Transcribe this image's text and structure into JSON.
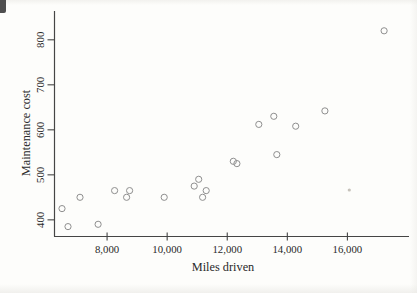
{
  "page": {
    "artifacts": {
      "corner_tab_color": "#4f4f4f",
      "speck_color": "#b3ada4"
    }
  },
  "chart_data": {
    "type": "scatter",
    "title": "",
    "xlabel": "Miles driven",
    "ylabel": "Maintenance cost",
    "xlim": [
      6250,
      18050
    ],
    "ylim": [
      363,
      864
    ],
    "grid": false,
    "legend": null,
    "axis_color": "#454545",
    "text_color": "#2a2a2a",
    "marker": {
      "shape": "open-circle",
      "radius": 3.1,
      "color": "#8f8f8f"
    },
    "xticks": [
      {
        "value": 8000,
        "label": "8,000"
      },
      {
        "value": 10000,
        "label": "10,000"
      },
      {
        "value": 12000,
        "label": "12,000"
      },
      {
        "value": 14000,
        "label": "14,000"
      },
      {
        "value": 16000,
        "label": "16,000"
      }
    ],
    "yticks": [
      {
        "value": 400,
        "label": "400"
      },
      {
        "value": 500,
        "label": "500"
      },
      {
        "value": 600,
        "label": "600"
      },
      {
        "value": 700,
        "label": "700"
      },
      {
        "value": 800,
        "label": "800"
      }
    ],
    "points": [
      {
        "miles": 6500,
        "cost": 425
      },
      {
        "miles": 6700,
        "cost": 385
      },
      {
        "miles": 7100,
        "cost": 450
      },
      {
        "miles": 7700,
        "cost": 390
      },
      {
        "miles": 8250,
        "cost": 465
      },
      {
        "miles": 8650,
        "cost": 450
      },
      {
        "miles": 8750,
        "cost": 465
      },
      {
        "miles": 9900,
        "cost": 450
      },
      {
        "miles": 10900,
        "cost": 475
      },
      {
        "miles": 11050,
        "cost": 490
      },
      {
        "miles": 11180,
        "cost": 450
      },
      {
        "miles": 11300,
        "cost": 465
      },
      {
        "miles": 12200,
        "cost": 530
      },
      {
        "miles": 12320,
        "cost": 525
      },
      {
        "miles": 13050,
        "cost": 612
      },
      {
        "miles": 13550,
        "cost": 630
      },
      {
        "miles": 13650,
        "cost": 545
      },
      {
        "miles": 14280,
        "cost": 608
      },
      {
        "miles": 15250,
        "cost": 642
      },
      {
        "miles": 17220,
        "cost": 820
      }
    ]
  }
}
